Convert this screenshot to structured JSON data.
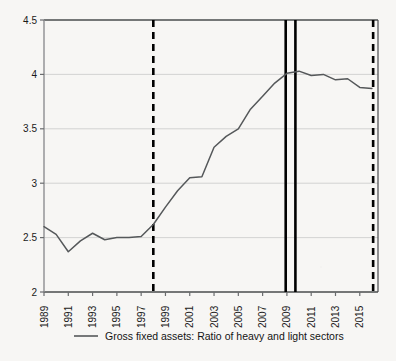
{
  "chart_data": {
    "type": "line",
    "title": "",
    "subtitle": "",
    "xlabel": "",
    "ylabel": "",
    "ylim": [
      2,
      4.5
    ],
    "xlim": [
      1989,
      2016.5
    ],
    "grid": "horizontal",
    "legend_position": "bottom",
    "y_ticks": [
      "2",
      "2.5",
      "3",
      "3.5",
      "4",
      "4.5"
    ],
    "y_tick_values": [
      2,
      2.5,
      3,
      3.5,
      4,
      4.5
    ],
    "x_ticks": [
      "1989",
      "1991",
      "1993",
      "1995",
      "1997",
      "1999",
      "2001",
      "2003",
      "2005",
      "2007",
      "2009",
      "2011",
      "2013",
      "2015"
    ],
    "x_tick_values": [
      1989,
      1991,
      1993,
      1995,
      1997,
      1999,
      2001,
      2003,
      2005,
      2007,
      2009,
      2011,
      2013,
      2015
    ],
    "series": [
      {
        "name": "Gross fixed assets: Ratio of heavy and light sectors",
        "color": "#55585a",
        "x": [
          1989,
          1990,
          1991,
          1992,
          1993,
          1994,
          1995,
          1996,
          1997,
          1998,
          1999,
          2000,
          2001,
          2002,
          2003,
          2004,
          2005,
          2006,
          2007,
          2008,
          2009,
          2010,
          2011,
          2012,
          2013,
          2014,
          2015,
          2016
        ],
        "values": [
          2.6,
          2.53,
          2.37,
          2.47,
          2.54,
          2.48,
          2.5,
          2.5,
          2.51,
          2.62,
          2.78,
          2.93,
          3.05,
          3.06,
          3.33,
          3.43,
          3.5,
          3.68,
          3.8,
          3.92,
          4.01,
          4.03,
          3.99,
          4.0,
          3.95,
          3.96,
          3.88,
          3.87
        ]
      }
    ],
    "annotations": [
      {
        "name": "dashed-marker-left",
        "type": "vline",
        "style": "dashed",
        "x": 1998,
        "color": "#000000"
      },
      {
        "name": "solid-marker-first",
        "type": "vline",
        "style": "solid",
        "x": 2008.9,
        "color": "#000000"
      },
      {
        "name": "solid-marker-second",
        "type": "vline",
        "style": "solid",
        "x": 2009.7,
        "color": "#000000"
      },
      {
        "name": "dashed-marker-right",
        "type": "vline",
        "style": "dashed",
        "x": 2016.1,
        "color": "#000000"
      }
    ]
  },
  "legend": {
    "entries": [
      {
        "label": "Gross fixed assets: Ratio of heavy and light sectors",
        "color": "#55585a"
      }
    ]
  },
  "colors": {
    "background": "#f7f6f4",
    "axis": "#6a6c6e",
    "grid": "#c9c9c9",
    "series": "#55585a",
    "marker": "#000000",
    "text": "#1a1a1a"
  }
}
